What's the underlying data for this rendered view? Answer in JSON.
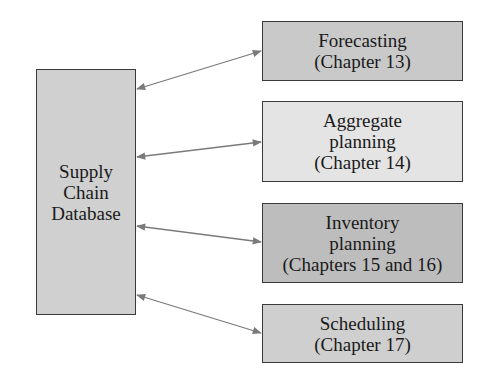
{
  "database": {
    "lines": [
      "Supply",
      "Chain",
      "Database"
    ],
    "fill": "#d0d0d0"
  },
  "modules": [
    {
      "lines": [
        "Forecasting",
        "(Chapter 13)"
      ],
      "fill": "#c9c9c9"
    },
    {
      "lines": [
        "Aggregate",
        "planning",
        "(Chapter 14)"
      ],
      "fill": "#e4e4e4"
    },
    {
      "lines": [
        "Inventory",
        "planning",
        "(Chapters 15 and 16)"
      ],
      "fill": "#bdbdbd"
    },
    {
      "lines": [
        "Scheduling",
        "(Chapter 17)"
      ],
      "fill": "#cfcfcf"
    }
  ],
  "colors": {
    "arrow": "#7a7a7a",
    "border": "#3a3a3a"
  }
}
